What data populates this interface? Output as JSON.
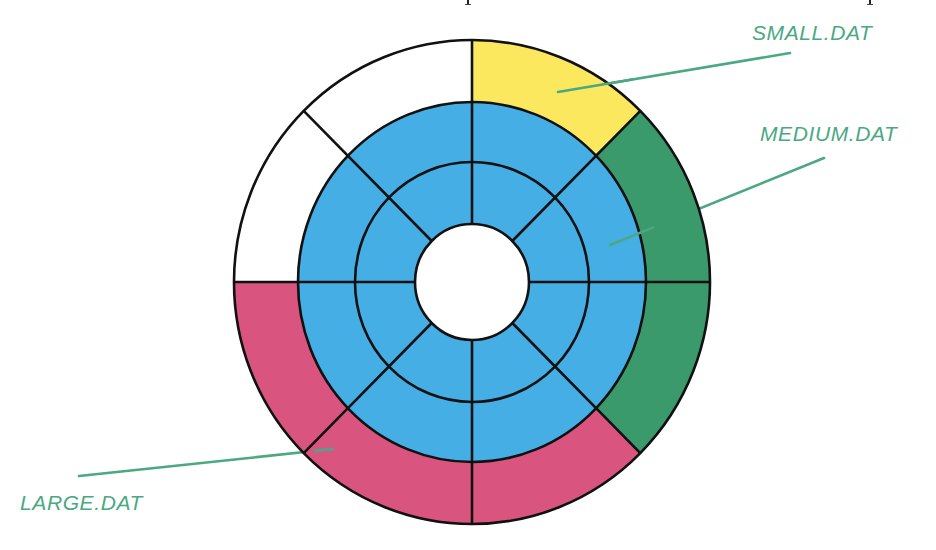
{
  "diagram": {
    "type": "disk-sector-allocation",
    "center": {
      "x": 472,
      "y": 282
    },
    "rings": [
      {
        "name": "hole",
        "rx": 57,
        "ry": 58
      },
      {
        "name": "inner-track",
        "rx": 117,
        "ry": 120
      },
      {
        "name": "middle-track",
        "rx": 174,
        "ry": 180
      },
      {
        "name": "outer-track",
        "rx": 238,
        "ry": 242
      }
    ],
    "sector_count": 8,
    "colors": {
      "free": "#ffffff",
      "blue": "#45aee5",
      "small": "#fbe85e",
      "medium": "#3a9a6c",
      "large": "#d9557f",
      "stroke": "#111111",
      "leader": "#4aa882"
    },
    "outer_track_sectors": [
      {
        "index": 0,
        "from_deg": -90,
        "to_deg": -45,
        "fill": "small"
      },
      {
        "index": 1,
        "from_deg": -45,
        "to_deg": 0,
        "fill": "medium"
      },
      {
        "index": 2,
        "from_deg": 0,
        "to_deg": 45,
        "fill": "medium"
      },
      {
        "index": 3,
        "from_deg": 45,
        "to_deg": 90,
        "fill": "large"
      },
      {
        "index": 4,
        "from_deg": 90,
        "to_deg": 135,
        "fill": "large"
      },
      {
        "index": 5,
        "from_deg": 135,
        "to_deg": 180,
        "fill": "large"
      },
      {
        "index": 6,
        "from_deg": 180,
        "to_deg": 225,
        "fill": "free"
      },
      {
        "index": 7,
        "from_deg": 225,
        "to_deg": 270,
        "fill": "free"
      }
    ],
    "inner_tracks_fill": "blue"
  },
  "labels": [
    {
      "id": "small",
      "text": "SMALL.DAT",
      "x": 752,
      "y": 22,
      "leader": {
        "x1": 558,
        "y1": 92,
        "x2": 790,
        "y2": 53
      }
    },
    {
      "id": "medium",
      "text": "MEDIUM.DAT",
      "x": 760,
      "y": 123,
      "leader": {
        "x1": 610,
        "y1": 245,
        "x2": 824,
        "y2": 158
      }
    },
    {
      "id": "large",
      "text": "LARGE.DAT",
      "x": 20,
      "y": 492,
      "leader": {
        "x1": 79,
        "y1": 476,
        "x2": 333,
        "y2": 449
      }
    }
  ],
  "cutoff_marks": [
    {
      "x": 467
    },
    {
      "x": 869
    }
  ]
}
